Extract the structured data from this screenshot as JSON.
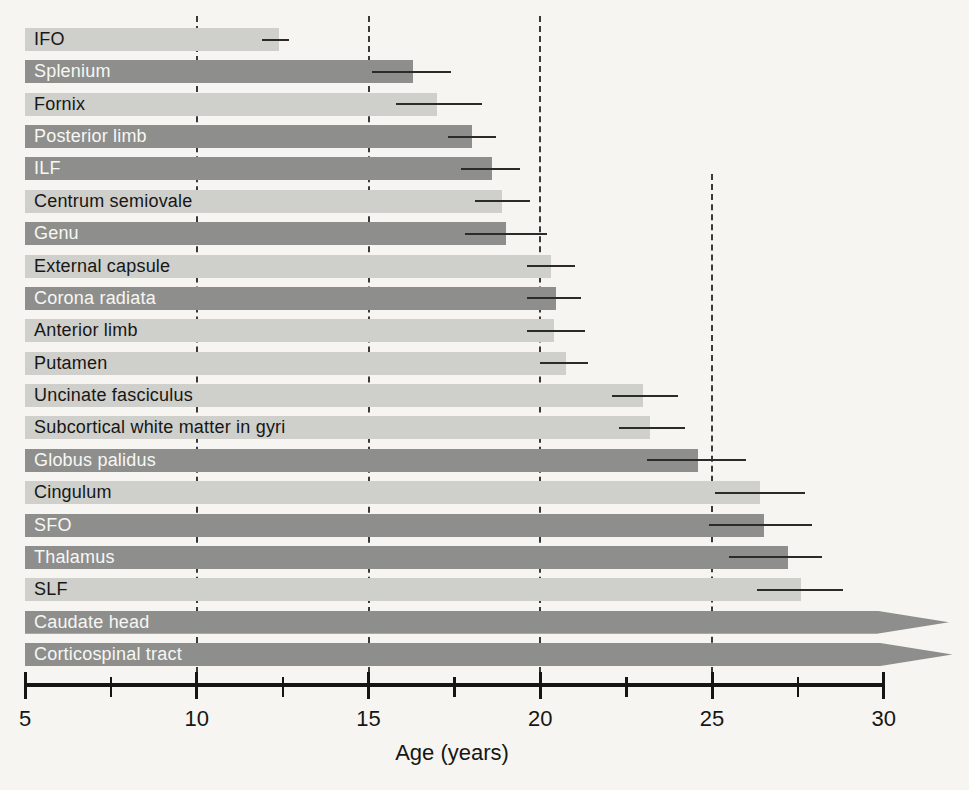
{
  "chart_data": {
    "type": "bar",
    "orientation": "horizontal",
    "xlabel": "Age (years)",
    "xlim": [
      5,
      32
    ],
    "x_major_ticks": [
      5,
      10,
      15,
      20,
      25,
      30
    ],
    "x_minor_ticks": [
      7.5,
      12.5,
      17.5,
      22.5,
      27.5
    ],
    "dashed_reference_ages": [
      10,
      15,
      20,
      25
    ],
    "colors": {
      "bar_light": "#cfcfcc",
      "bar_dark": "#8e8f8c",
      "label_on_light": "#171715",
      "label_on_dark": "#f7f7f4",
      "line": "#2b2b29",
      "background": "#f6f5f2"
    },
    "rows": [
      {
        "label": "IFO",
        "shade": "light",
        "maturation_age": 12.4,
        "ci_low": 11.9,
        "ci_high": 12.7
      },
      {
        "label": "Splenium",
        "shade": "dark",
        "maturation_age": 16.3,
        "ci_low": 15.1,
        "ci_high": 17.4
      },
      {
        "label": "Fornix",
        "shade": "light",
        "maturation_age": 17.0,
        "ci_low": 15.8,
        "ci_high": 18.3
      },
      {
        "label": "Posterior limb",
        "shade": "dark",
        "maturation_age": 18.0,
        "ci_low": 17.3,
        "ci_high": 18.7
      },
      {
        "label": "ILF",
        "shade": "dark",
        "maturation_age": 18.6,
        "ci_low": 17.7,
        "ci_high": 19.4
      },
      {
        "label": "Centrum semiovale",
        "shade": "light",
        "maturation_age": 18.9,
        "ci_low": 18.1,
        "ci_high": 19.7
      },
      {
        "label": "Genu",
        "shade": "dark",
        "maturation_age": 19.0,
        "ci_low": 17.8,
        "ci_high": 20.2
      },
      {
        "label": "External capsule",
        "shade": "light",
        "maturation_age": 20.3,
        "ci_low": 19.6,
        "ci_high": 21.0
      },
      {
        "label": "Corona radiata",
        "shade": "dark",
        "maturation_age": 20.45,
        "ci_low": 19.6,
        "ci_high": 21.2
      },
      {
        "label": "Anterior limb",
        "shade": "light",
        "maturation_age": 20.4,
        "ci_low": 19.6,
        "ci_high": 21.3
      },
      {
        "label": "Putamen",
        "shade": "light",
        "maturation_age": 20.75,
        "ci_low": 20.0,
        "ci_high": 21.4
      },
      {
        "label": "Uncinate fasciculus",
        "shade": "light",
        "maturation_age": 23.0,
        "ci_low": 22.1,
        "ci_high": 24.0
      },
      {
        "label": "Subcortical white matter in gyri",
        "shade": "light",
        "maturation_age": 23.2,
        "ci_low": 22.3,
        "ci_high": 24.2
      },
      {
        "label": "Globus palidus",
        "shade": "dark",
        "maturation_age": 24.6,
        "ci_low": 23.1,
        "ci_high": 26.0
      },
      {
        "label": "Cingulum",
        "shade": "light",
        "maturation_age": 26.4,
        "ci_low": 25.1,
        "ci_high": 27.7
      },
      {
        "label": "SFO",
        "shade": "dark",
        "maturation_age": 26.5,
        "ci_low": 24.9,
        "ci_high": 27.9
      },
      {
        "label": "Thalamus",
        "shade": "dark",
        "maturation_age": 27.2,
        "ci_low": 25.5,
        "ci_high": 28.2
      },
      {
        "label": "SLF",
        "shade": "light",
        "maturation_age": 27.6,
        "ci_low": 26.3,
        "ci_high": 28.8
      },
      {
        "label": "Caudate head",
        "shade": "dark",
        "maturation_age": ">30",
        "arrow_beyond_axis": true,
        "arrow_base_age": 29.8,
        "arrow_tip_age": 31.9
      },
      {
        "label": "Corticospinal tract",
        "shade": "dark",
        "maturation_age": ">30",
        "arrow_beyond_axis": true,
        "arrow_base_age": 29.9,
        "arrow_tip_age": 32.0
      }
    ]
  }
}
